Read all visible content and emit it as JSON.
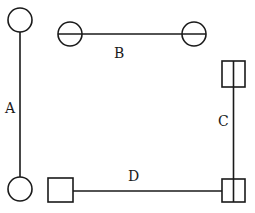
{
  "diagram": {
    "stroke_color": "#1a1a1a",
    "background": "#ffffff",
    "links": [
      {
        "label": "A",
        "orientation": "vertical",
        "end_types": [
          "circle",
          "circle"
        ],
        "label_pos": [
          9,
          113
        ]
      },
      {
        "label": "B",
        "orientation": "horizontal",
        "end_types": [
          "circle-with-line",
          "circle-with-line"
        ],
        "label_pos": [
          119,
          58
        ]
      },
      {
        "label": "C",
        "orientation": "vertical",
        "end_types": [
          "square-with-line",
          "square-with-line"
        ],
        "label_pos": [
          222,
          126
        ]
      },
      {
        "label": "D",
        "orientation": "horizontal",
        "end_types": [
          "square",
          "square-with-line"
        ],
        "label_pos": [
          133,
          181
        ]
      }
    ]
  }
}
